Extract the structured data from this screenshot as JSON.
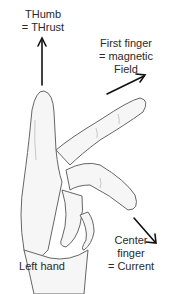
{
  "labels": {
    "thumb": {
      "line1": "THumb",
      "line2": "= THrust"
    },
    "first_finger": {
      "line1": "First finger",
      "line2": "= magnetic",
      "line3": "Field"
    },
    "center_finger": {
      "line1": "Center",
      "line2": "finger",
      "line3": "= Current"
    },
    "hand": "Left hand"
  },
  "colors": {
    "arrow": "#111111",
    "outline": "#555555",
    "shade": "#d8d8d8"
  }
}
